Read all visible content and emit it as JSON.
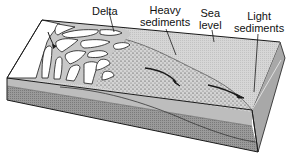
{
  "figure": {
    "type": "block-diagram",
    "labels": {
      "delta": "Delta",
      "heavy_sediments_line1": "Heavy",
      "heavy_sediments_line2": "sediments",
      "sea_level_line1": "Sea",
      "sea_level_line2": "level",
      "light_sediments_line1": "Light",
      "light_sediments_line2": "sediments"
    },
    "colors": {
      "line": "#1a1a1a",
      "land_white": "#ffffff",
      "channel_gray": "#c8c8c8",
      "sea_surface": "#d9d9d9",
      "front_upper": "#bdbdbd",
      "front_lower": "#8f8f8f",
      "side_face": "#a8a8a8"
    }
  }
}
